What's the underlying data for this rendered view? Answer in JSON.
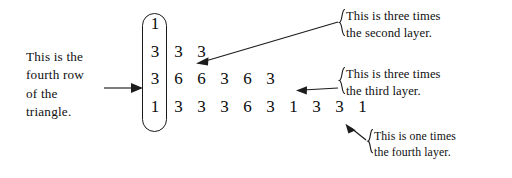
{
  "figure": {
    "ink_color": "#101010",
    "background_color": "#ffffff"
  },
  "captions": {
    "left": {
      "name": "fourth-row-caption",
      "lines": [
        "This is the",
        "fourth row",
        "of the",
        "triangle."
      ]
    },
    "right_top": {
      "name": "second-layer-caption",
      "brace": "{",
      "lines": [
        "This is three times",
        "the  second  layer."
      ]
    },
    "right_middle": {
      "name": "third-layer-caption",
      "brace": "{",
      "lines": [
        "This is three times",
        "the   third   layer."
      ]
    },
    "right_bottom": {
      "name": "fourth-layer-caption",
      "brace": "{",
      "lines": [
        "This is one times",
        "the fourth layer."
      ]
    }
  },
  "triangle": {
    "name": "number-triangle",
    "highlight_column_shape": "rounded-rectangle",
    "rows": [
      {
        "first": "1",
        "rest": []
      },
      {
        "first": "3",
        "rest": [
          "3",
          "3"
        ]
      },
      {
        "first": "3",
        "rest": [
          "6",
          "6",
          "3",
          "6",
          "3"
        ]
      },
      {
        "first": "1",
        "rest": [
          "3",
          "3",
          "3",
          "6",
          "3",
          "1",
          "3",
          "3",
          "1"
        ]
      }
    ]
  },
  "arrows": [
    {
      "name": "arrow-to-second-row",
      "from": "second-layer-caption",
      "to": "triangle-row-2"
    },
    {
      "name": "arrow-to-third-row",
      "from": "third-layer-caption",
      "to": "triangle-row-3"
    },
    {
      "name": "arrow-to-fourth-row",
      "from": "fourth-layer-caption",
      "to": "triangle-row-4"
    },
    {
      "name": "arrow-to-first-column",
      "from": "fourth-row-caption",
      "to": "triangle-first-column"
    }
  ]
}
